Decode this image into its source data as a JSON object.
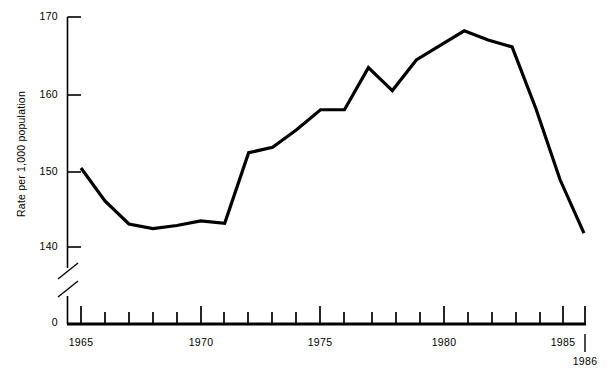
{
  "chart_data": {
    "type": "line",
    "title": "",
    "subtitle": "",
    "xlabel": "",
    "ylabel": "Rate per 1,000 population",
    "x": [
      1965,
      1966,
      1967,
      1968,
      1969,
      1970,
      1971,
      1972,
      1973,
      1974,
      1975,
      1976,
      1977,
      1978,
      1979,
      1980,
      1981,
      1982,
      1983,
      1984,
      1985,
      1986
    ],
    "values": [
      150.3,
      146.0,
      143.0,
      142.4,
      142.8,
      143.4,
      143.1,
      152.3,
      153.0,
      155.3,
      157.9,
      157.9,
      163.4,
      160.4,
      164.4,
      166.3,
      168.2,
      167.0,
      166.1,
      158.0,
      148.8,
      141.8
    ],
    "series": [
      {
        "name": "Rate per 1,000 population",
        "values": [
          150.3,
          146.0,
          143.0,
          142.4,
          142.8,
          143.4,
          143.1,
          152.3,
          153.0,
          155.3,
          157.9,
          157.9,
          163.4,
          160.4,
          164.4,
          166.3,
          168.2,
          167.0,
          166.1,
          158.0,
          148.8,
          141.8
        ]
      }
    ],
    "ylim": [
      138,
      170
    ],
    "xlim": [
      1964,
      1986
    ],
    "y_ticks": [
      140,
      150,
      160,
      170
    ],
    "y_tick_labels": [
      "140",
      "150",
      "160",
      "170"
    ],
    "y_zero_label": "0",
    "y_axis_break": true,
    "x_ticks": [
      1965,
      1966,
      1967,
      1968,
      1969,
      1970,
      1971,
      1972,
      1973,
      1974,
      1975,
      1976,
      1977,
      1978,
      1979,
      1980,
      1981,
      1982,
      1983,
      1984,
      1985,
      1986
    ],
    "x_tick_labels": [
      "1965",
      "1970",
      "1975",
      "1980",
      "1985",
      "1986"
    ],
    "x_labeled_ticks": [
      1965,
      1970,
      1975,
      1980,
      1985,
      1986
    ],
    "grid": false,
    "legend": "none",
    "line_color": "#000000",
    "axis_color": "#000000",
    "background_color": "#ffffff",
    "annotations": []
  },
  "axis": {
    "y_label_170": "170",
    "y_label_160": "160",
    "y_label_150": "150",
    "y_label_140": "140",
    "y_label_0": "0",
    "y_title": "Rate per 1,000 population",
    "x_label_1965": "1965",
    "x_label_1970": "1970",
    "x_label_1975": "1975",
    "x_label_1980": "1980",
    "x_label_1985": "1985",
    "x_label_1986": "1986"
  }
}
